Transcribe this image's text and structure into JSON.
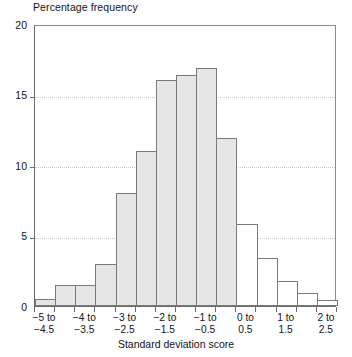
{
  "chart_data": {
    "type": "bar",
    "title": "Percentage frequency",
    "xlabel": "Standard deviation score",
    "ylabel": "Percentage frequency",
    "ylim": [
      0,
      20
    ],
    "yticks": [
      0,
      5,
      10,
      15,
      20
    ],
    "ytick_labels": [
      "0",
      "5",
      "10",
      "15",
      "20"
    ],
    "grid": true,
    "legend": "none",
    "bin_width": 0.5,
    "x_range": [
      -5,
      2.5
    ],
    "bin_edges": [
      -5,
      -4.5,
      -4,
      -3.5,
      -3,
      -2.5,
      -2,
      -1.5,
      -1,
      -0.5,
      0,
      0.5,
      1,
      1.5,
      2,
      2.5
    ],
    "categories": [
      "-5 to -4.5",
      "-4.5 to -4",
      "-4 to -3.5",
      "-3.5 to -3",
      "-3 to -2.5",
      "-2.5 to -2",
      "-2 to -1.5",
      "-1.5 to -1",
      "-1 to -0.5",
      "-0.5 to 0",
      "0 to 0.5",
      "0.5 to 1",
      "1 to 1.5",
      "1.5 to 2",
      "2 to 2.5"
    ],
    "values": [
      0.5,
      1.5,
      1.5,
      3.0,
      8.0,
      11.0,
      16.0,
      16.4,
      16.9,
      11.9,
      5.8,
      3.4,
      1.8,
      0.9,
      0.4
    ],
    "bar_styles": [
      "shaded",
      "shaded",
      "shaded",
      "shaded",
      "shaded",
      "shaded",
      "shaded",
      "shaded",
      "shaded",
      "shaded",
      "plain",
      "plain",
      "plain",
      "plain",
      "plain"
    ],
    "tick_labels": [
      {
        "line1": "−5 to",
        "line2": "−4.5",
        "at_bin": 0
      },
      {
        "line1": "−4 to",
        "line2": "−3.5",
        "at_bin": 2
      },
      {
        "line1": "−3 to",
        "line2": "−2.5",
        "at_bin": 4
      },
      {
        "line1": "−2 to",
        "line2": "−1.5",
        "at_bin": 6
      },
      {
        "line1": "−1 to",
        "line2": "−0.5",
        "at_bin": 8
      },
      {
        "line1": "0 to",
        "line2": "0.5",
        "at_bin": 10
      },
      {
        "line1": "1 to",
        "line2": "1.5",
        "at_bin": 12
      },
      {
        "line1": "2 to",
        "line2": "2.5",
        "at_bin": 14
      }
    ],
    "colors": {
      "shaded_fill": "#e6e6e6",
      "plain_fill": "#ffffff",
      "bar_edge": "#7a7a7a",
      "axis": "#6b6b6b",
      "grid": "#c9c9c9",
      "text": "#141414"
    }
  }
}
